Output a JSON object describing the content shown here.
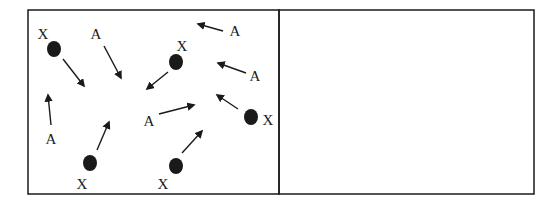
{
  "diagram": {
    "colors": {
      "ink": "#1a1a1a",
      "background": "#ffffff"
    },
    "panels": [
      {
        "id": "left",
        "box": {
          "x": 28,
          "y": 10,
          "w": 251,
          "h": 184
        },
        "particles_x": [
          {
            "label": "X",
            "dot": [
              54,
              49
            ],
            "label_pos": [
              43,
              36
            ],
            "arrow": [
              [
                63,
                59
              ],
              [
                84,
                86
              ]
            ]
          },
          {
            "label": "X",
            "dot": [
              176,
              62
            ],
            "label_pos": [
              182,
              48
            ],
            "arrow": [
              [
                168,
                72
              ],
              [
                147,
                89
              ]
            ]
          },
          {
            "label": "X",
            "dot": [
              251,
              117
            ],
            "label_pos": [
              268,
              122
            ],
            "arrow": [
              [
                238,
                109
              ],
              [
                217,
                95
              ]
            ]
          },
          {
            "label": "X",
            "dot": [
              90,
              163
            ],
            "label_pos": [
              82,
              186
            ],
            "arrow": [
              [
                97,
                150
              ],
              [
                109,
                122
              ]
            ]
          },
          {
            "label": "X",
            "dot": [
              176,
              166
            ],
            "label_pos": [
              163,
              186
            ],
            "arrow": [
              [
                182,
                153
              ],
              [
                202,
                131
              ]
            ]
          }
        ],
        "particles_a": [
          {
            "label": "A",
            "label_pos": [
              96,
              36
            ],
            "arrow": [
              [
                104,
                46
              ],
              [
                121,
                78
              ]
            ]
          },
          {
            "label": "A",
            "label_pos": [
              235,
              33
            ],
            "arrow": [
              [
                223,
                31
              ],
              [
                198,
                24
              ]
            ]
          },
          {
            "label": "A",
            "label_pos": [
              255,
              78
            ],
            "arrow": [
              [
                246,
                73
              ],
              [
                218,
                63
              ]
            ]
          },
          {
            "label": "A",
            "label_pos": [
              51,
              141
            ],
            "arrow": [
              [
                51,
                125
              ],
              [
                48,
                95
              ]
            ]
          },
          {
            "label": "A",
            "label_pos": [
              149,
              123
            ],
            "arrow": [
              [
                159,
                114
              ],
              [
                194,
                105
              ]
            ]
          }
        ]
      },
      {
        "id": "right",
        "box": {
          "x": 279,
          "y": 10,
          "w": 255,
          "h": 184
        },
        "particles_x": [],
        "particles_a": []
      }
    ]
  }
}
